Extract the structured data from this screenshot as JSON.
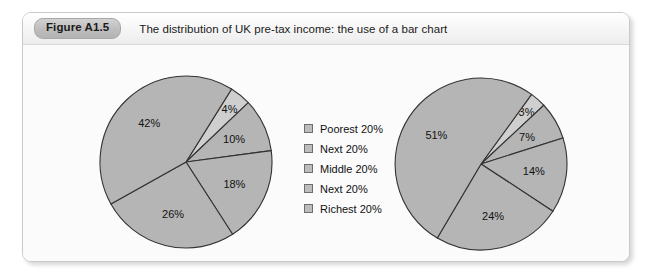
{
  "figure": {
    "badge": "Figure A1.5",
    "caption": "The distribution of UK pre-tax income: the use of a bar chart"
  },
  "legend": {
    "items": [
      {
        "label": "Poorest 20%",
        "swatch_color": "#bdbdbd"
      },
      {
        "label": "Next 20%",
        "swatch_color": "#bdbdbd"
      },
      {
        "label": "Middle 20%",
        "swatch_color": "#bdbdbd"
      },
      {
        "label": "Next 20%",
        "swatch_color": "#bdbdbd"
      },
      {
        "label": "Richest 20%",
        "swatch_color": "#bdbdbd"
      }
    ]
  },
  "chart_data": [
    {
      "type": "pie",
      "title": "1977",
      "categories": [
        "Poorest 20%",
        "Next 20%",
        "Middle 20%",
        "Next 20%",
        "Richest 20%"
      ],
      "values": [
        4,
        10,
        18,
        26,
        42
      ],
      "value_labels": [
        "4%",
        "10%",
        "18%",
        "26%",
        "42%"
      ],
      "unit": "%",
      "legend": "shared-center",
      "colors": [
        "#cfcfcf",
        "#b5b5b5",
        "#b5b5b5",
        "#b5b5b5",
        "#b5b5b5"
      ]
    },
    {
      "type": "pie",
      "title": "2012/13",
      "categories": [
        "Poorest 20%",
        "Next 20%",
        "Middle 20%",
        "Next 20%",
        "Richest 20%"
      ],
      "values": [
        3,
        7,
        14,
        24,
        51
      ],
      "value_labels": [
        "3%",
        "7%",
        "14%",
        "24%",
        "51%"
      ],
      "unit": "%",
      "legend": "shared-center",
      "colors": [
        "#cfcfcf",
        "#b5b5b5",
        "#b5b5b5",
        "#b5b5b5",
        "#b5b5b5"
      ]
    }
  ]
}
